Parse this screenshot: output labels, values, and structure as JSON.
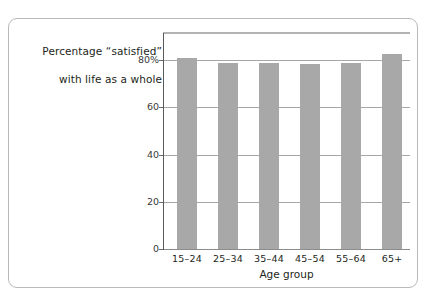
{
  "chart_data": {
    "type": "bar",
    "title_lines": [
      "Percentage “satisfied”",
      "with life as a whole"
    ],
    "xlabel": "Age group",
    "ylabel": "",
    "categories": [
      "15–24",
      "25–34",
      "35–44",
      "45–54",
      "55–64",
      "65+"
    ],
    "values": [
      81,
      79,
      79,
      78.5,
      79,
      82.5
    ],
    "ylim": [
      0,
      92
    ],
    "yticks": [
      0,
      20,
      40,
      60,
      80
    ],
    "ytick_labels": [
      "0",
      "20",
      "40",
      "60",
      "80%"
    ],
    "grid": true,
    "legend": false,
    "bar_color": "#a8a8a8",
    "gridline_color": "#a7a7a7",
    "axis_color": "#58595b",
    "top_rule_color": "#b2b2b2",
    "frame_color": "#b9b9b9",
    "background_color": "#ffffff"
  }
}
